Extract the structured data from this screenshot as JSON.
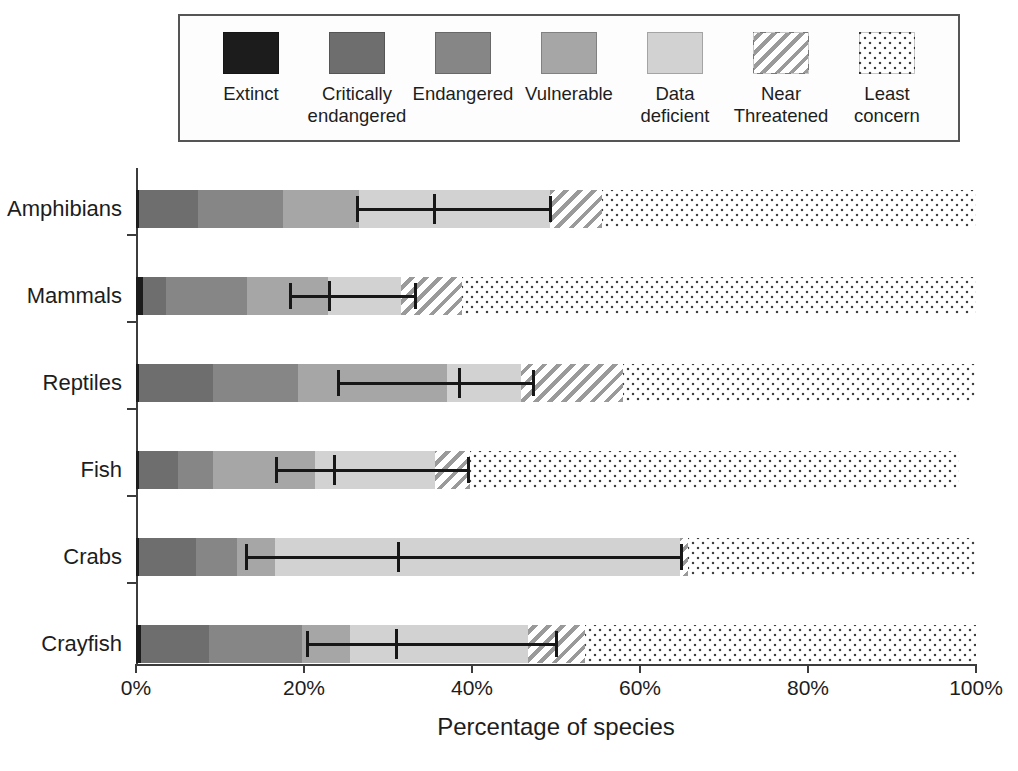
{
  "chart_data": {
    "type": "bar",
    "orientation": "horizontal",
    "stacked": true,
    "title": "",
    "xlabel": "Percentage of species",
    "ylabel": "",
    "xlim": [
      0,
      100
    ],
    "xticks": [
      "0%",
      "20%",
      "40%",
      "60%",
      "80%",
      "100%"
    ],
    "xtick_values": [
      0,
      20,
      40,
      60,
      80,
      100
    ],
    "grid": false,
    "legend_position": "top",
    "categories": [
      "Amphibians",
      "Mammals",
      "Reptiles",
      "Fish",
      "Crabs",
      "Crayfish"
    ],
    "series": [
      {
        "name": "Extinct",
        "color": "#1c1c1c",
        "pattern": "solid",
        "values": [
          0.4,
          0.8,
          0.3,
          0.4,
          0.3,
          0.6
        ]
      },
      {
        "name": "Critically endangered",
        "color": "#6e6e6e",
        "pattern": "solid",
        "values": [
          7.0,
          2.8,
          8.9,
          4.6,
          6.9,
          8.1
        ]
      },
      {
        "name": "Endangered",
        "color": "#868686",
        "pattern": "solid",
        "values": [
          10.1,
          9.6,
          10.1,
          4.2,
          4.8,
          11.1
        ]
      },
      {
        "name": "Vulnerable",
        "color": "#a6a6a6",
        "pattern": "solid",
        "values": [
          9.0,
          9.7,
          17.7,
          12.1,
          4.6,
          5.7
        ]
      },
      {
        "name": "Data deficient",
        "color": "#d2d2d2",
        "pattern": "solid",
        "values": [
          22.8,
          8.6,
          8.8,
          14.3,
          48.2,
          21.2
        ]
      },
      {
        "name": "Near Threatened",
        "color": "#ffffff",
        "pattern": "hatch",
        "values": [
          6.2,
          7.3,
          12.2,
          4.2,
          0.9,
          6.8
        ]
      },
      {
        "name": "Least concern",
        "color": "#ffffff",
        "pattern": "dots",
        "values": [
          44.5,
          61.2,
          42.0,
          58.2,
          34.3,
          46.5
        ]
      }
    ],
    "error_bars": [
      {
        "category": "Amphibians",
        "mean": 35.5,
        "low": 26.3,
        "high": 49.3
      },
      {
        "category": "Mammals",
        "mean": 23.0,
        "low": 18.3,
        "high": 33.2
      },
      {
        "category": "Reptiles",
        "mean": 38.4,
        "low": 24.0,
        "high": 47.3
      },
      {
        "category": "Fish",
        "mean": 23.6,
        "low": 16.7,
        "high": 39.5
      },
      {
        "category": "Crabs",
        "mean": 31.2,
        "low": 13.1,
        "high": 64.9
      },
      {
        "category": "Crayfish",
        "mean": 31.0,
        "low": 20.3,
        "high": 50.0
      }
    ]
  },
  "legend": {
    "items": [
      {
        "label": "Extinct",
        "swatch": "extinct-swatch",
        "color": "#1c1c1c",
        "pattern": "solid"
      },
      {
        "label": "Critically\nendangered",
        "swatch": "critically-endangered-swatch",
        "color": "#6e6e6e",
        "pattern": "solid"
      },
      {
        "label": "Endangered",
        "swatch": "endangered-swatch",
        "color": "#868686",
        "pattern": "solid"
      },
      {
        "label": "Vulnerable",
        "swatch": "vulnerable-swatch",
        "color": "#a6a6a6",
        "pattern": "solid"
      },
      {
        "label": "Data\ndeficient",
        "swatch": "data-deficient-swatch",
        "color": "#d2d2d2",
        "pattern": "solid"
      },
      {
        "label": "Near\nThreatened",
        "swatch": "near-threatened-swatch",
        "color": "#ffffff",
        "pattern": "hatch"
      },
      {
        "label": "Least\nconcern",
        "swatch": "least-concern-swatch",
        "color": "#ffffff",
        "pattern": "dots"
      }
    ]
  },
  "axes": {
    "x_title": "Percentage of species",
    "x_tick_labels": [
      "0%",
      "20%",
      "40%",
      "60%",
      "80%",
      "100%"
    ],
    "y_tick_labels": [
      "Amphibians",
      "Mammals",
      "Reptiles",
      "Fish",
      "Crabs",
      "Crayfish"
    ]
  }
}
